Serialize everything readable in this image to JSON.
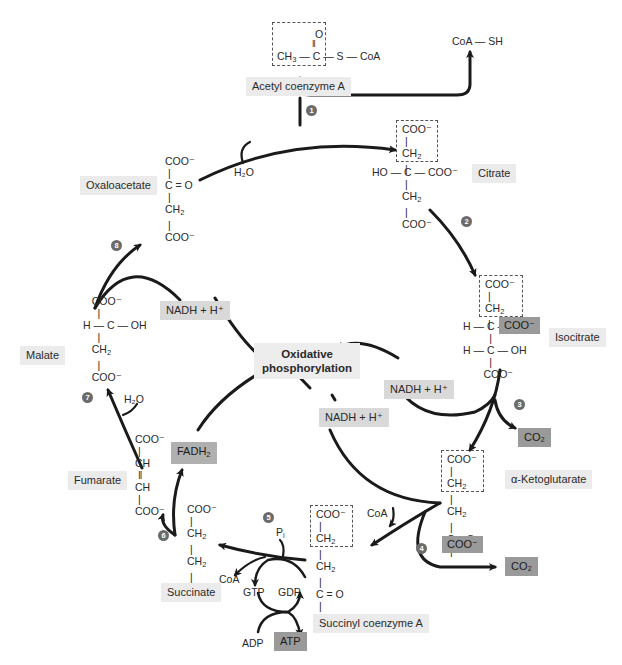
{
  "diagram": {
    "center": {
      "line1": "Oxidative",
      "line2": "phosphorylation"
    },
    "molecules": {
      "acetyl_coa": {
        "label": "Acetyl coenzyme A",
        "formula_o": "O",
        "formula_main": "CH3 — C — S — CoA"
      },
      "coa_sh": {
        "label": "CoA — SH"
      },
      "citrate": {
        "label": "Citrate",
        "rows": [
          "COO⁻",
          "CH₂",
          "HO — C — COO⁻",
          "CH₂",
          "COO⁻"
        ]
      },
      "isocitrate": {
        "label": "Isocitrate",
        "rows": [
          "COO⁻",
          "CH₂",
          "H — C —",
          "H — C — OH",
          "COO⁻"
        ],
        "highlight": "COO⁻"
      },
      "alpha_ketoglutarate": {
        "label": "α-Ketoglutarate",
        "rows": [
          "COO⁻",
          "CH₂",
          "CH₂",
          "C = O"
        ],
        "highlight": "COO⁻"
      },
      "succinyl_coa": {
        "label": "Succinyl coenzyme A",
        "rows": [
          "COO⁻",
          "CH₂",
          "CH₂",
          "C = O",
          "S — CoA"
        ]
      },
      "succinate": {
        "label": "Succinate",
        "rows": [
          "COO⁻",
          "CH₂",
          "CH₂",
          "COO⁻"
        ]
      },
      "fumarate": {
        "label": "Fumarate",
        "rows": [
          "COO⁻",
          "CH",
          "CH",
          "COO⁻"
        ]
      },
      "malate": {
        "label": "Malate",
        "rows": [
          "COO⁻",
          "H — C — OH",
          "CH₂",
          "COO⁻"
        ]
      },
      "oxaloacetate": {
        "label": "Oxaloacetate",
        "rows": [
          "COO⁻",
          "C = O",
          "CH₂",
          "COO⁻"
        ]
      }
    },
    "cofactors": {
      "nadh_1": "NADH + H⁺",
      "nadh_2": "NADH + H⁺",
      "nadh_3": "NADH + H⁺",
      "fadh2": "FADH₂",
      "co2_1": "CO₂",
      "co2_2": "CO₂",
      "h2o_1": "H₂O",
      "h2o_2": "H₂O",
      "coa_1": "CoA",
      "coa_2": "CoA",
      "pi": "Pᵢ",
      "gtp": "GTP",
      "gdp": "GDP",
      "adp": "ADP",
      "atp": "ATP"
    },
    "steps": [
      "1",
      "2",
      "3",
      "4",
      "5",
      "6",
      "7",
      "8"
    ],
    "colors": {
      "highlight": "#9a9a9a",
      "label_bg": "#ebebeb",
      "nadh_bg": "#d9d9d9",
      "arrow": "#1a1a1a",
      "step_badge": "#6b6b6b"
    }
  }
}
